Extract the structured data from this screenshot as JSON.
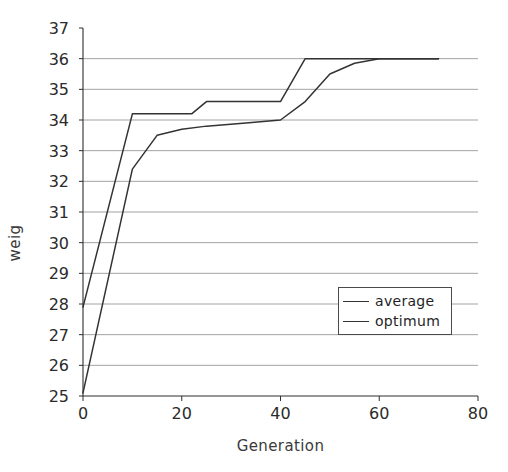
{
  "chart_data": {
    "type": "line",
    "title": "",
    "xlabel": "Generation",
    "ylabel": "weig",
    "xlim": [
      0,
      80
    ],
    "ylim": [
      25,
      37
    ],
    "xticks": [
      0,
      20,
      40,
      60,
      80
    ],
    "yticks": [
      25,
      26,
      27,
      28,
      29,
      30,
      31,
      32,
      33,
      34,
      35,
      36,
      37
    ],
    "grid": "horizontal",
    "legend_position": "inside-lower-right",
    "series": [
      {
        "name": "average",
        "color": "#333333",
        "points": [
          [
            0,
            25.1
          ],
          [
            10,
            32.4
          ],
          [
            15,
            33.5
          ],
          [
            20,
            33.7
          ],
          [
            25,
            33.8
          ],
          [
            33,
            33.9
          ],
          [
            40,
            34.0
          ],
          [
            45,
            34.6
          ],
          [
            50,
            35.5
          ],
          [
            55,
            35.85
          ],
          [
            60,
            36.0
          ],
          [
            72,
            36.0
          ]
        ]
      },
      {
        "name": "optimum",
        "color": "#333333",
        "points": [
          [
            0,
            27.9
          ],
          [
            10,
            34.2
          ],
          [
            22,
            34.2
          ],
          [
            25,
            34.6
          ],
          [
            40,
            34.6
          ],
          [
            45,
            36.0
          ],
          [
            72,
            36.0
          ]
        ]
      }
    ]
  },
  "axes": {
    "y_title": "weig",
    "x_title": "Generation",
    "y_tick_labels": [
      "37",
      "36",
      "35",
      "34",
      "33",
      "32",
      "31",
      "30",
      "29",
      "28",
      "27",
      "26",
      "25"
    ],
    "x_tick_labels": [
      "0",
      "20",
      "40",
      "60",
      "80"
    ]
  },
  "legend": {
    "items": [
      {
        "label": "average"
      },
      {
        "label": "optimum"
      }
    ]
  },
  "colors": {
    "line": "#333333",
    "grid": "#8a8a8a",
    "axis": "#2f2f2f",
    "text": "#2b2b2b",
    "background": "#ffffff"
  }
}
